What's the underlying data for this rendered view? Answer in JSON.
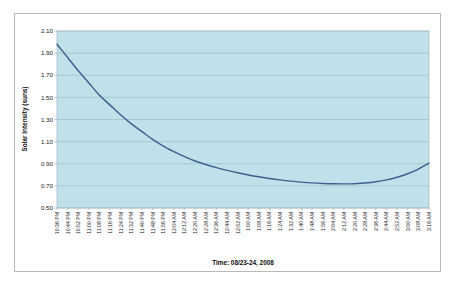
{
  "chart_data": {
    "type": "line",
    "title": "",
    "xlabel": "Time: 08/23-24, 2008",
    "ylabel": "Solar Intensity (suns)",
    "ylim": [
      0.5,
      2.1
    ],
    "ytick_step": 0.2,
    "grid": true,
    "legend": false,
    "plot_bgcolor": "#bfe2ea",
    "line_color": "#3f5f8f",
    "gridline_color": "#9fb6bf",
    "yticks": [
      "0.50",
      "0.70",
      "0.90",
      "1.10",
      "1.30",
      "1.50",
      "1.70",
      "1.90",
      "2.10"
    ],
    "categories": [
      "10:36 PM",
      "10:44 PM",
      "10:52 PM",
      "11:00 PM",
      "11:08 PM",
      "11:16 PM",
      "11:24 PM",
      "11:32 PM",
      "11:40 PM",
      "11:48 PM",
      "11:56 PM",
      "12:04 AM",
      "12:12 AM",
      "12:20 AM",
      "12:28 AM",
      "12:36 AM",
      "12:44 AM",
      "12:52 AM",
      "1:00 AM",
      "1:08 AM",
      "1:16 AM",
      "1:24 AM",
      "1:32 AM",
      "1:40 AM",
      "1:48 AM",
      "1:56 AM",
      "2:04 AM",
      "2:12 AM",
      "2:20 AM",
      "2:28 AM",
      "2:36 AM",
      "2:44 AM",
      "2:52 AM",
      "3:00 AM",
      "3:08 AM",
      "3:16 AM"
    ],
    "series": [
      {
        "name": "Solar Intensity",
        "values": [
          1.98,
          1.86,
          1.74,
          1.63,
          1.52,
          1.43,
          1.34,
          1.26,
          1.19,
          1.12,
          1.06,
          1.01,
          0.965,
          0.925,
          0.893,
          0.865,
          0.84,
          0.818,
          0.799,
          0.782,
          0.767,
          0.754,
          0.743,
          0.734,
          0.727,
          0.722,
          0.719,
          0.718,
          0.72,
          0.726,
          0.737,
          0.754,
          0.778,
          0.81,
          0.852,
          0.905
        ]
      }
    ]
  }
}
